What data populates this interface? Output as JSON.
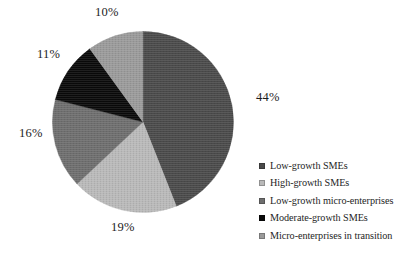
{
  "chart_data": {
    "type": "pie",
    "title": "",
    "subtitle": "",
    "xlabel": "",
    "ylabel": "",
    "legend_position": "right",
    "grid": false,
    "start_angle_deg": 0,
    "direction": "clockwise",
    "categories": [
      "Low-growth SMEs",
      "High-growth SMEs",
      "Low-growth micro-enterprises",
      "Moderate-growth SMEs",
      "Micro-enterprises in transition"
    ],
    "values": [
      44,
      19,
      16,
      11,
      10
    ],
    "value_unit": "%",
    "data_labels": [
      "44%",
      "19%",
      "16%",
      "11%",
      "10%"
    ],
    "colors": [
      "#4a4a4a",
      "#b9b9b9",
      "#6e6e6e",
      "#0a0a0a",
      "#9a9a9a"
    ],
    "slices": [
      {
        "label": "Low-growth SMEs",
        "value": 44,
        "display": "44%",
        "color": "#4a4a4a"
      },
      {
        "label": "High-growth SMEs",
        "value": 19,
        "display": "19%",
        "color": "#b9b9b9"
      },
      {
        "label": "Low-growth micro-enterprises",
        "value": 16,
        "display": "16%",
        "color": "#6e6e6e"
      },
      {
        "label": "Moderate-growth SMEs",
        "value": 11,
        "display": "11%",
        "color": "#0a0a0a"
      },
      {
        "label": "Micro-enterprises in transition",
        "value": 10,
        "display": "10%",
        "color": "#9a9a9a"
      }
    ]
  },
  "labels": {
    "pct_44": "44%",
    "pct_19": "19%",
    "pct_16": "16%",
    "pct_11": "11%",
    "pct_10": "10%"
  },
  "legend": {
    "items": [
      {
        "label": "Low-growth SMEs",
        "color": "#4a4a4a"
      },
      {
        "label": "High-growth SMEs",
        "color": "#b9b9b9"
      },
      {
        "label": "Low-growth micro-enterprises",
        "color": "#6e6e6e"
      },
      {
        "label": "Moderate-growth SMEs",
        "color": "#0a0a0a"
      },
      {
        "label": "Micro-enterprises in transition",
        "color": "#9a9a9a"
      }
    ]
  }
}
